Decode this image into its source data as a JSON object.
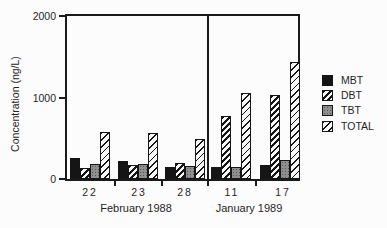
{
  "chart_data": {
    "type": "bar",
    "title": "",
    "xlabel": "",
    "ylabel": "Concentration (ng/L)",
    "ylim": [
      0,
      2000
    ],
    "yticks": [
      "0",
      "1000",
      "2000"
    ],
    "grid": false,
    "legend_position": "right",
    "panels": [
      {
        "label": "February 1988",
        "categories": [
          "22",
          "23",
          "28"
        ]
      },
      {
        "label": "January 1989",
        "categories": [
          "11",
          "17"
        ]
      }
    ],
    "categories": [
      "22",
      "23",
      "28",
      "11",
      "17"
    ],
    "series": [
      {
        "name": "MBT",
        "pattern": "solid-black",
        "values": [
          260,
          220,
          150,
          150,
          175
        ]
      },
      {
        "name": "DBT",
        "pattern": "dark-diagonal-hatch",
        "values": [
          140,
          175,
          195,
          770,
          1030
        ]
      },
      {
        "name": "TBT",
        "pattern": "gray-stipple",
        "values": [
          190,
          180,
          155,
          145,
          230
        ]
      },
      {
        "name": "TOTAL",
        "pattern": "light-diagonal-hatch",
        "values": [
          580,
          570,
          490,
          1050,
          1430
        ]
      }
    ]
  },
  "colors": {
    "ink": "#1a1a1a",
    "background": "#fcfcfc",
    "tbt_gray": "#8f8f8f"
  }
}
